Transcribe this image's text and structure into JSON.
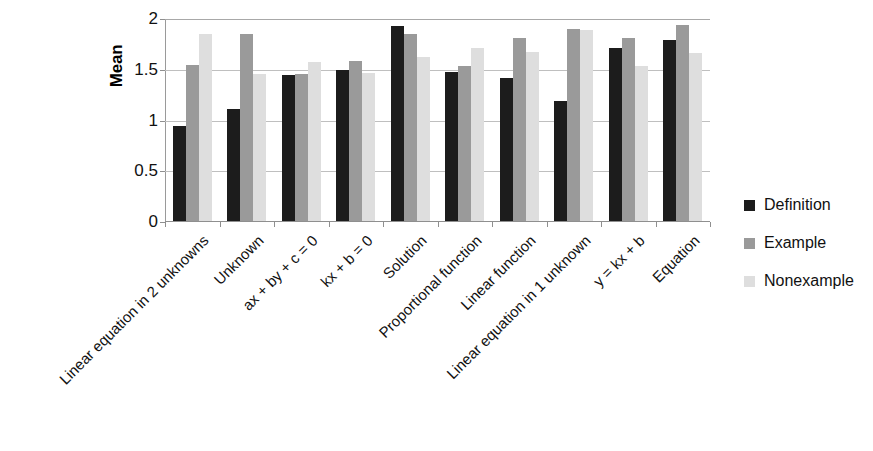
{
  "chart_data": {
    "type": "bar",
    "title": "",
    "xlabel": "",
    "ylabel": "Mean",
    "ylim": [
      0,
      2
    ],
    "yticks": [
      0,
      0.5,
      1,
      1.5,
      2
    ],
    "ytick_labels": [
      "0",
      "0.5",
      "1",
      "1.5",
      "2"
    ],
    "grid": true,
    "legend_position": "right",
    "categories": [
      "Linear equation in 2 unknowns",
      "Unknown",
      "ax + by + c = 0",
      "kx + b = 0",
      "Solution",
      "Proportional function",
      "Linear function",
      "Linear equation in 1 unknown",
      "y = kx + b",
      "Equation"
    ],
    "series": [
      {
        "name": "Definition",
        "color": "#1c1c1c",
        "values": [
          0.94,
          1.1,
          1.44,
          1.49,
          1.92,
          1.47,
          1.41,
          1.18,
          1.7,
          1.78
        ]
      },
      {
        "name": "Example",
        "color": "#9a9a9a",
        "values": [
          1.54,
          1.84,
          1.45,
          1.58,
          1.84,
          1.53,
          1.8,
          1.89,
          1.8,
          1.93
        ]
      },
      {
        "name": "Nonexample",
        "color": "#dedede",
        "values": [
          1.84,
          1.45,
          1.57,
          1.46,
          1.62,
          1.7,
          1.67,
          1.88,
          1.53,
          1.66
        ]
      }
    ]
  },
  "legend": {
    "items": [
      {
        "label": "Definition",
        "key": "definition"
      },
      {
        "label": "Example",
        "key": "example"
      },
      {
        "label": "Nonexample",
        "key": "nonexample"
      }
    ]
  }
}
